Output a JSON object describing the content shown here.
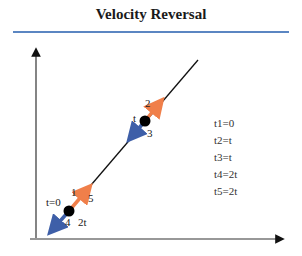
{
  "title": "Velocity Reversal",
  "colors": {
    "accent_rule": "#5b86c2",
    "forward": "#f07f4a",
    "backward": "#3e5fa8",
    "line": "#111111"
  },
  "points": [
    {
      "label": "t=0",
      "index_labels": [
        "1",
        "5",
        "4",
        "2t"
      ]
    },
    {
      "label": "t",
      "index_labels": [
        "2",
        "3"
      ]
    }
  ],
  "labels": {
    "p1_t": "t=0",
    "p1_a": "1",
    "p1_b": "5",
    "p1_c": "4",
    "p1_d": "2t",
    "p2_t": "t",
    "p2_a": "2",
    "p2_b": "3"
  },
  "legend": [
    "t1=0",
    "t2=t",
    "t3=t",
    "t4=2t",
    "t5=2t"
  ]
}
